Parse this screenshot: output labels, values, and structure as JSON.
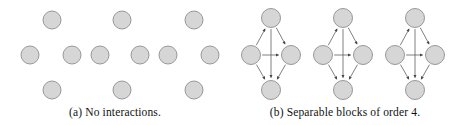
{
  "figure": {
    "width": 460,
    "height": 125,
    "background": "#ffffff",
    "node_fill": "#d6d6d6",
    "node_stroke": "#8f8f8f",
    "edge_color": "#555555",
    "caption_color": "#111111"
  },
  "panels": [
    {
      "id": "a",
      "caption_label": "(a)",
      "caption_text": "No interactions.",
      "caption_full": "(a) No interactions.",
      "description": "twelve isolated nodes with no edges",
      "node_radius": 9,
      "node_count": 12,
      "edge_count": 0,
      "nodes": [
        {
          "id": "a1",
          "cx": 52,
          "cy": 20
        },
        {
          "id": "a2",
          "cx": 122,
          "cy": 20
        },
        {
          "id": "a3",
          "cx": 194,
          "cy": 20
        },
        {
          "id": "a4",
          "cx": 30,
          "cy": 55
        },
        {
          "id": "a5",
          "cx": 72,
          "cy": 55
        },
        {
          "id": "a6",
          "cx": 100,
          "cy": 55
        },
        {
          "id": "a7",
          "cx": 140,
          "cy": 55
        },
        {
          "id": "a8",
          "cx": 168,
          "cy": 55
        },
        {
          "id": "a9",
          "cx": 210,
          "cy": 55
        },
        {
          "id": "a10",
          "cx": 52,
          "cy": 90
        },
        {
          "id": "a11",
          "cx": 122,
          "cy": 90
        },
        {
          "id": "a12",
          "cx": 194,
          "cy": 90
        }
      ],
      "edges": []
    },
    {
      "id": "b",
      "caption_label": "(b)",
      "caption_text": "Separable blocks of order 4.",
      "caption_full": "(b) Separable blocks of order 4.",
      "description": "three identical diamond-shaped directed blocks, each of order 4",
      "node_radius": 9.5,
      "block_count": 3,
      "block_order": 4,
      "edges_per_block": 6,
      "blocks": [
        {
          "id": "b1",
          "nodes": [
            {
              "id": "b1-top",
              "role": "top",
              "cx": 41,
              "cy": 18
            },
            {
              "id": "b1-left",
              "role": "left",
              "cx": 21,
              "cy": 55
            },
            {
              "id": "b1-right",
              "role": "right",
              "cx": 61,
              "cy": 55
            },
            {
              "id": "b1-bottom",
              "role": "bottom",
              "cx": 41,
              "cy": 90
            }
          ],
          "edges": [
            {
              "from": "left",
              "to": "top"
            },
            {
              "from": "top",
              "to": "right"
            },
            {
              "from": "left",
              "to": "right"
            },
            {
              "from": "left",
              "to": "bottom"
            },
            {
              "from": "top",
              "to": "bottom"
            },
            {
              "from": "right",
              "to": "bottom"
            }
          ]
        },
        {
          "id": "b2",
          "nodes": [
            {
              "id": "b2-top",
              "role": "top",
              "cx": 113,
              "cy": 18
            },
            {
              "id": "b2-left",
              "role": "left",
              "cx": 93,
              "cy": 55
            },
            {
              "id": "b2-right",
              "role": "right",
              "cx": 133,
              "cy": 55
            },
            {
              "id": "b2-bottom",
              "role": "bottom",
              "cx": 113,
              "cy": 90
            }
          ],
          "edges": [
            {
              "from": "left",
              "to": "top"
            },
            {
              "from": "top",
              "to": "right"
            },
            {
              "from": "left",
              "to": "right"
            },
            {
              "from": "left",
              "to": "bottom"
            },
            {
              "from": "top",
              "to": "bottom"
            },
            {
              "from": "right",
              "to": "bottom"
            }
          ]
        },
        {
          "id": "b3",
          "nodes": [
            {
              "id": "b3-top",
              "role": "top",
              "cx": 185,
              "cy": 18
            },
            {
              "id": "b3-left",
              "role": "left",
              "cx": 165,
              "cy": 55
            },
            {
              "id": "b3-right",
              "role": "right",
              "cx": 205,
              "cy": 55
            },
            {
              "id": "b3-bottom",
              "role": "bottom",
              "cx": 185,
              "cy": 90
            }
          ],
          "edges": [
            {
              "from": "left",
              "to": "top"
            },
            {
              "from": "top",
              "to": "right"
            },
            {
              "from": "left",
              "to": "right"
            },
            {
              "from": "left",
              "to": "bottom"
            },
            {
              "from": "top",
              "to": "bottom"
            },
            {
              "from": "right",
              "to": "bottom"
            }
          ]
        }
      ]
    }
  ]
}
